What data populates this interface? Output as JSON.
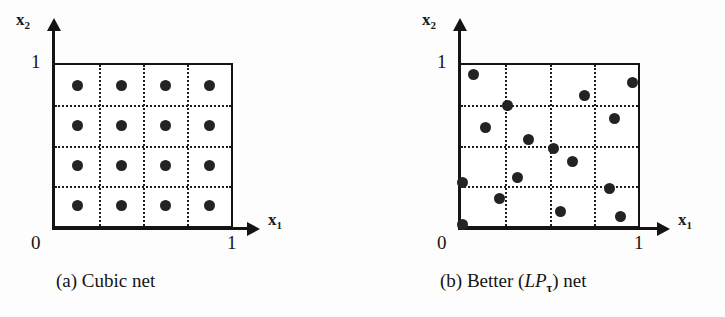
{
  "figure": {
    "background_color": "#fdfdfd",
    "ink_color": "#141414",
    "dot_color": "#232323"
  },
  "chart_data": {
    "type": "scatter",
    "title": "",
    "panels": [
      {
        "id": "a",
        "caption": "(a) Cubic net",
        "caption_prefix": "(a) Cubic net",
        "xlabel": "x",
        "xlabel_sub": "1",
        "ylabel": "x",
        "ylabel_sub": "2",
        "xlim": [
          0,
          1
        ],
        "ylim": [
          0,
          1
        ],
        "xticks": [
          "0",
          "1"
        ],
        "yticks": [
          "0",
          "1"
        ],
        "grid": true,
        "grid_style": "dotted",
        "grid_divisions": 4,
        "grid_x": [
          0.25,
          0.5,
          0.75
        ],
        "grid_y": [
          0.25,
          0.5,
          0.75
        ],
        "n_points": 16,
        "points": [
          [
            0.125,
            0.875
          ],
          [
            0.375,
            0.875
          ],
          [
            0.625,
            0.875
          ],
          [
            0.875,
            0.875
          ],
          [
            0.125,
            0.625
          ],
          [
            0.375,
            0.625
          ],
          [
            0.625,
            0.625
          ],
          [
            0.875,
            0.625
          ],
          [
            0.125,
            0.375
          ],
          [
            0.375,
            0.375
          ],
          [
            0.625,
            0.375
          ],
          [
            0.875,
            0.375
          ],
          [
            0.125,
            0.125
          ],
          [
            0.375,
            0.125
          ],
          [
            0.625,
            0.125
          ],
          [
            0.875,
            0.125
          ]
        ]
      },
      {
        "id": "b",
        "caption": "(b) Better (LPτ) net",
        "caption_before": "(b) Better (",
        "caption_italic": "LP",
        "caption_sub": "τ",
        "caption_after": ") net",
        "xlabel": "x",
        "xlabel_sub": "1",
        "ylabel": "x",
        "ylabel_sub": "2",
        "xlim": [
          0,
          1
        ],
        "ylim": [
          0,
          1
        ],
        "xticks": [
          "0",
          "1"
        ],
        "yticks": [
          "0",
          "1"
        ],
        "grid": true,
        "grid_style": "dotted",
        "grid_divisions": 4,
        "grid_x": [
          0.25,
          0.5,
          0.75
        ],
        "grid_y": [
          0.25,
          0.5,
          0.75
        ],
        "n_points": 16,
        "points": [
          [
            0.07,
            0.94
          ],
          [
            0.97,
            0.89
          ],
          [
            0.7,
            0.81
          ],
          [
            0.26,
            0.75
          ],
          [
            0.87,
            0.67
          ],
          [
            0.14,
            0.61
          ],
          [
            0.38,
            0.54
          ],
          [
            0.52,
            0.48
          ],
          [
            0.63,
            0.4
          ],
          [
            0.32,
            0.3
          ],
          [
            0.01,
            0.27
          ],
          [
            0.84,
            0.23
          ],
          [
            0.22,
            0.17
          ],
          [
            0.56,
            0.09
          ],
          [
            0.9,
            0.06
          ],
          [
            0.01,
            0.01
          ]
        ]
      }
    ]
  }
}
